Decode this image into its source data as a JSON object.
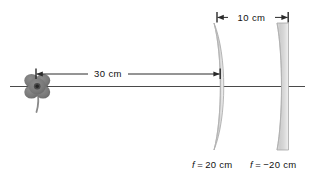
{
  "figure": {
    "background_color": "#ffffff",
    "axis_color": "#4a4a4a",
    "line_color": "#2a2a2a",
    "lens_fill_light": "#f2f2f2",
    "lens_fill_mid": "#cfcfcf",
    "lens_edge": "#9a9a9a",
    "object_color": "#7a7a7a",
    "object_core_color": "#3d3d3d"
  },
  "dimensions": [
    {
      "id": "object-to-lens1",
      "label": "30  cm",
      "value": 30,
      "unit": "cm",
      "from": "object",
      "to": "converging-lens"
    },
    {
      "id": "lens1-to-lens2",
      "label": "10  cm",
      "value": 10,
      "unit": "cm",
      "from": "converging-lens",
      "to": "diverging-lens"
    }
  ],
  "elements": {
    "object": {
      "name": "flower",
      "petals": 4
    },
    "converging_lens": {
      "type": "biconvex",
      "focal_label_prefix": "f",
      "focal_label_equals": "=",
      "focal_label_value": "20  cm",
      "focal_length": 20,
      "unit": "cm"
    },
    "diverging_lens": {
      "type": "biconcave",
      "focal_label_prefix": "f",
      "focal_label_equals": "=",
      "focal_label_value": "−20  cm",
      "focal_length": -20,
      "unit": "cm"
    }
  }
}
